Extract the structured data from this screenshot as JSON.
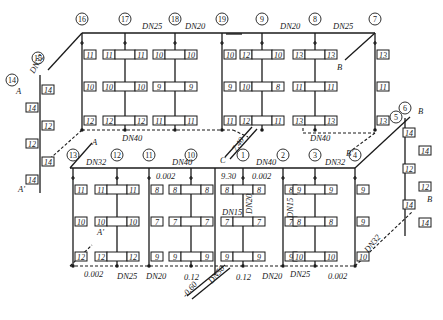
{
  "risers_top": [
    {
      "id": "16",
      "x": 82,
      "radiators": [
        [
          "11"
        ],
        [
          "10"
        ],
        [
          "12"
        ]
      ],
      "single": true
    },
    {
      "id": "17",
      "x": 125,
      "radiators": [
        [
          "11",
          "11"
        ],
        [
          "10",
          "10"
        ],
        [
          "12",
          "12"
        ]
      ]
    },
    {
      "id": "18",
      "x": 175,
      "radiators": [
        [
          "10",
          "10"
        ],
        [
          "9",
          "9"
        ],
        [
          "11",
          "11"
        ]
      ]
    },
    {
      "id": "19",
      "x": 222,
      "radiators": [
        [
          "10"
        ],
        [
          "9"
        ],
        [
          "11"
        ]
      ],
      "single": true
    },
    {
      "id": "9",
      "x": 262,
      "radiators": [
        [
          "12",
          "10"
        ],
        [
          "10",
          "8"
        ],
        [
          "12",
          "11"
        ]
      ]
    },
    {
      "id": "8",
      "x": 315,
      "radiators": [
        [
          "13",
          "13"
        ],
        [
          "11",
          "11"
        ],
        [
          "13",
          "13"
        ]
      ]
    },
    {
      "id": "7",
      "x": 375,
      "radiators": [
        [
          "13"
        ],
        [
          "11"
        ],
        [
          "13"
        ]
      ],
      "single": true
    }
  ],
  "risers_bottom": [
    {
      "id": "13",
      "x": 73,
      "radiators": [
        [
          "11"
        ],
        [
          "10"
        ],
        [
          "12"
        ]
      ],
      "single": true
    },
    {
      "id": "12",
      "x": 117,
      "radiators": [
        [
          "11",
          "11"
        ],
        [
          "10",
          "10"
        ],
        [
          "12",
          "12"
        ]
      ]
    },
    {
      "id": "11",
      "x": 149,
      "radiators": [
        [
          "8"
        ],
        [
          "7"
        ],
        [
          "9"
        ]
      ],
      "single": true
    },
    {
      "id": "10",
      "x": 191,
      "radiators": [
        [
          "8",
          "8"
        ],
        [
          "7",
          "7"
        ],
        [
          "9",
          "9"
        ]
      ]
    },
    {
      "id": "1",
      "x": 243,
      "radiators": [
        [
          "8",
          "8"
        ],
        [
          "7",
          "7"
        ],
        [
          "9",
          "9"
        ]
      ]
    },
    {
      "id": "2",
      "x": 283,
      "radiators": [
        [
          "8"
        ],
        [
          "7"
        ],
        [
          "9"
        ]
      ],
      "single": true
    },
    {
      "id": "3",
      "x": 315,
      "radiators": [
        [
          "9",
          "9"
        ],
        [
          "8",
          "8"
        ],
        [
          "10",
          "10"
        ]
      ]
    },
    {
      "id": "4",
      "x": 355,
      "radiators": [
        [
          "9"
        ],
        [
          "9"
        ],
        [
          "10"
        ]
      ],
      "single": true
    }
  ],
  "riser_left": {
    "ids": [
      "14",
      "15"
    ],
    "radiators": [
      "14",
      "14",
      "12",
      "12",
      "14",
      "14"
    ]
  },
  "riser_right": {
    "ids": [
      "5",
      "6"
    ],
    "radiators": [
      "14",
      "14",
      "12",
      "12",
      "14",
      "14"
    ]
  },
  "pipe_labels": {
    "top_dn25_a": "DN25",
    "top_dn20_a": "DN20",
    "top_dn20_b": "DN20",
    "top_dn25_b": "DN25",
    "top_ret_dn40_a": "DN40",
    "top_ret_dn40_b": "DN40",
    "left_dn32": "DN32",
    "bot_dn32_a": "DN32",
    "bot_dn40_a": "DN40",
    "bot_slope_a": "0.002",
    "bot_dn40_b": "DN40",
    "bot_slope_b": "0.002",
    "bot_dn32_b": "DN32",
    "elev_930": "9.30",
    "elev_740": "7.40",
    "dn15_a": "DN15",
    "dn20_v": "DN20",
    "dn15_b": "DN15",
    "ret_slope_left": "0.002",
    "ret_dn25_a": "DN25",
    "ret_dn20_a": "DN20",
    "ret_012_a": "0.12",
    "dn50": "DN50",
    "elev_060": "-0.60",
    "ret_012_b": "0.12",
    "ret_dn20_b": "DN20",
    "ret_dn25_b": "DN25",
    "ret_slope_right": "0.002",
    "right_dn32": "DN32"
  },
  "markers": {
    "A": "A",
    "A_prime": "A'",
    "A_prime2": "A'",
    "B": "B",
    "B_prime": "B'",
    "B2": "B",
    "C": "C"
  },
  "colors": {
    "line": "#1a1a1a",
    "background": "#ffffff"
  }
}
